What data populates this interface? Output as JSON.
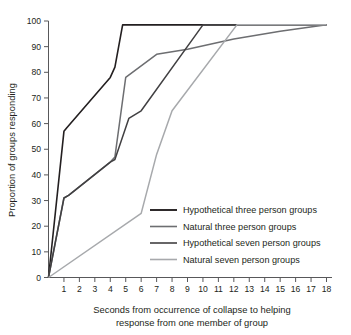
{
  "chart_data": {
    "type": "line",
    "title": "",
    "xlabel": "Seconds from occurrence of collapse to helping response from one member of group",
    "xlabel_line1": "Seconds from occurrence of collapse to helping",
    "xlabel_line2": "response from one member of group",
    "ylabel": "Proportion of groups responding",
    "xlim": [
      0,
      18
    ],
    "ylim": [
      0,
      100
    ],
    "xticks": [
      1,
      2,
      3,
      4,
      5,
      6,
      7,
      8,
      9,
      10,
      11,
      12,
      13,
      14,
      15,
      16,
      17,
      18
    ],
    "yticks": [
      0,
      10,
      20,
      30,
      40,
      50,
      60,
      70,
      80,
      90,
      100
    ],
    "grid": false,
    "legend_position": "inside-lower-right",
    "series": [
      {
        "name": "Hypothetical three person groups",
        "color": "#231f20",
        "width": 1.6,
        "x": [
          0,
          1,
          1.2,
          4,
          4.3,
          4.8,
          18
        ],
        "y": [
          0,
          57,
          58.5,
          78,
          82,
          98.5,
          98.5
        ]
      },
      {
        "name": "Natural three person groups",
        "color": "#6d6e71",
        "width": 1.5,
        "x": [
          0,
          1,
          1.3,
          4,
          4.3,
          5,
          7,
          9,
          12,
          15,
          18
        ],
        "y": [
          0,
          31,
          32,
          45,
          47,
          78,
          87,
          89,
          93,
          96,
          98.5
        ]
      },
      {
        "name": "Hypothetical seven person groups",
        "color": "#414042",
        "width": 1.5,
        "x": [
          0,
          1,
          1.3,
          4,
          4.3,
          5.2,
          6,
          10,
          18
        ],
        "y": [
          0,
          31,
          32,
          45,
          46,
          62,
          65,
          98.5,
          98.5
        ]
      },
      {
        "name": "Natural seven person groups",
        "color": "#a7a9ac",
        "width": 1.5,
        "x": [
          0,
          6,
          7,
          8,
          12.2,
          18
        ],
        "y": [
          0,
          25,
          48,
          65,
          98.5,
          98.5
        ]
      }
    ]
  },
  "legend": {
    "items": [
      {
        "label": "Hypothetical three person groups",
        "color": "#231f20"
      },
      {
        "label": "Natural three person groups",
        "color": "#6d6e71"
      },
      {
        "label": "Hypothetical seven person groups",
        "color": "#414042"
      },
      {
        "label": "Natural seven person groups",
        "color": "#a7a9ac"
      }
    ]
  }
}
